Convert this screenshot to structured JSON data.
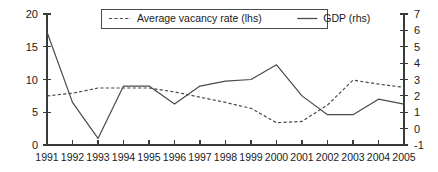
{
  "chart_data": {
    "type": "line",
    "title": "",
    "subtitle": "",
    "xlabel": "",
    "ylabel": "",
    "grid": false,
    "legend_position": "top-center",
    "categories": [
      "1991",
      "1992",
      "1993",
      "1994",
      "1995",
      "1996",
      "1997",
      "1998",
      "1999",
      "2000",
      "2001",
      "2002",
      "2003",
      "2004",
      "2005"
    ],
    "x": [
      1991,
      1992,
      1993,
      1994,
      1995,
      1996,
      1997,
      1998,
      1999,
      2000,
      2001,
      2002,
      2003,
      2004,
      2005
    ],
    "axes": {
      "left": {
        "label": "Average vacancy rate (lhs)",
        "ylim": [
          0,
          20
        ],
        "ticks": [
          0,
          5,
          10,
          15,
          20
        ],
        "tick_labels": [
          "0",
          "5",
          "10",
          "15",
          "20"
        ]
      },
      "right": {
        "label": "GDP (rhs)",
        "ylim": [
          -1,
          7
        ],
        "ticks": [
          -1,
          0,
          1,
          2,
          3,
          4,
          5,
          6,
          7
        ],
        "tick_labels": [
          "-1",
          "0",
          "1",
          "2",
          "3",
          "4",
          "5",
          "6",
          "7"
        ]
      },
      "x": {
        "ticks": [
          1991,
          1992,
          1993,
          1994,
          1995,
          1996,
          1997,
          1998,
          1999,
          2000,
          2001,
          2002,
          2003,
          2004,
          2005
        ],
        "tick_labels": [
          "1991",
          "1992",
          "1993",
          "1994",
          "1995",
          "1996",
          "1997",
          "1998",
          "1999",
          "2000",
          "2001",
          "2002",
          "2003",
          "2004",
          "2005"
        ]
      }
    },
    "series": [
      {
        "name": "Average vacancy rate (lhs)",
        "axis": "left",
        "style": "dashed",
        "color": "#4a4a4a",
        "values": [
          7.5,
          7.9,
          8.7,
          8.7,
          8.7,
          8.1,
          7.3,
          6.5,
          5.6,
          3.4,
          3.6,
          6.1,
          9.9,
          9.3,
          8.8
        ]
      },
      {
        "name": "GDP (rhs)",
        "axis": "right",
        "style": "solid",
        "color": "#4a4a4a",
        "values": [
          5.9,
          1.6,
          -0.6,
          2.6,
          2.6,
          1.5,
          2.6,
          2.9,
          3.0,
          3.9,
          2.0,
          0.85,
          0.85,
          1.8,
          1.5
        ]
      }
    ],
    "legend": [
      {
        "label": "Average vacancy rate (lhs)",
        "style": "dashed"
      },
      {
        "label": "GDP (rhs)",
        "style": "solid"
      }
    ]
  }
}
